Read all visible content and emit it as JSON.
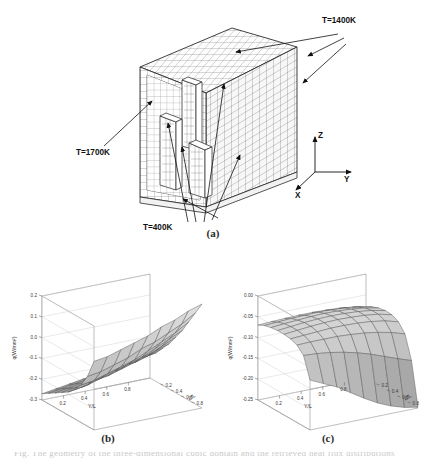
{
  "figure": {
    "panels": [
      {
        "id": "a",
        "caption": "(a)"
      },
      {
        "id": "b",
        "caption": "(b)"
      },
      {
        "id": "c",
        "caption": "(c)"
      }
    ],
    "truncated_caption_line": "Fig.  The geometry of the three-dimensional cubic domain and the retrieved heat flux distributions"
  },
  "panel_a": {
    "annotations": [
      {
        "name": "label-t1400",
        "text": "T=1400K"
      },
      {
        "name": "label-t1700",
        "text": "T=1700K"
      },
      {
        "name": "label-t400",
        "text": "T=400K"
      }
    ],
    "axis_triad": {
      "x": "X",
      "y": "Y",
      "z": "Z"
    },
    "mesh": {
      "cols": 22,
      "rows": 20,
      "line_color": "#4a4a4a"
    }
  },
  "chart_data": [
    {
      "id": "b",
      "type": "surface",
      "title": "(b)",
      "xlabel": "Y/L",
      "ylabel": "Z/L",
      "zlabel": "q(W/mm²)",
      "xticks": [
        0.8,
        0.6,
        0.4,
        0.2
      ],
      "yticks": [
        0.8,
        0.6,
        0.4,
        0.2
      ],
      "zticks": [
        0.2,
        0.1,
        0.0,
        -0.1,
        -0.2,
        -0.3
      ],
      "zlim": [
        -0.3,
        0.2
      ],
      "grid": true,
      "description": "Saddle-like surface rising steeply toward the far right corner, lowest along the near-left edge",
      "x": [
        0.1,
        0.2,
        0.3,
        0.4,
        0.5,
        0.6,
        0.7,
        0.8,
        0.9
      ],
      "y": [
        0.1,
        0.2,
        0.3,
        0.4,
        0.5,
        0.6,
        0.7,
        0.8,
        0.9
      ],
      "z": [
        [
          -0.27,
          -0.25,
          -0.23,
          -0.21,
          -0.19,
          -0.16,
          -0.12,
          -0.06,
          0.03
        ],
        [
          -0.26,
          -0.24,
          -0.22,
          -0.2,
          -0.18,
          -0.15,
          -0.11,
          -0.05,
          0.04
        ],
        [
          -0.25,
          -0.23,
          -0.21,
          -0.19,
          -0.16,
          -0.13,
          -0.09,
          -0.03,
          0.06
        ],
        [
          -0.24,
          -0.22,
          -0.2,
          -0.17,
          -0.15,
          -0.11,
          -0.07,
          -0.01,
          0.08
        ],
        [
          -0.23,
          -0.21,
          -0.18,
          -0.16,
          -0.13,
          -0.09,
          -0.05,
          0.02,
          0.1
        ],
        [
          -0.22,
          -0.2,
          -0.17,
          -0.14,
          -0.11,
          -0.07,
          -0.02,
          0.04,
          0.13
        ],
        [
          -0.21,
          -0.18,
          -0.16,
          -0.12,
          -0.09,
          -0.04,
          0.01,
          0.07,
          0.15
        ],
        [
          -0.2,
          -0.17,
          -0.14,
          -0.1,
          -0.06,
          -0.01,
          0.04,
          0.1,
          0.18
        ],
        [
          -0.19,
          -0.16,
          -0.12,
          -0.08,
          -0.03,
          0.02,
          0.08,
          0.14,
          0.2
        ]
      ]
    },
    {
      "id": "c",
      "type": "surface",
      "title": "(c)",
      "xlabel": "Y/L",
      "ylabel": "Z/L",
      "zlabel": "q(W/mm²)",
      "xticks": [
        0.8,
        0.6,
        0.4,
        0.2
      ],
      "yticks": [
        0.8,
        0.6,
        0.4,
        0.2
      ],
      "zticks": [
        0.0,
        -0.05,
        -0.1,
        -0.15,
        -0.2,
        -0.25
      ],
      "zlim": [
        -0.25,
        0.0
      ],
      "grid": true,
      "description": "Gently domed surface near the back, dropping sharply into a trough along the near-right front edge",
      "x": [
        0.1,
        0.2,
        0.3,
        0.4,
        0.5,
        0.6,
        0.7,
        0.8,
        0.9
      ],
      "y": [
        0.1,
        0.2,
        0.3,
        0.4,
        0.5,
        0.6,
        0.7,
        0.8,
        0.9
      ],
      "z": [
        [
          -0.07,
          -0.062,
          -0.058,
          -0.056,
          -0.056,
          -0.058,
          -0.064,
          -0.08,
          -0.13
        ],
        [
          -0.068,
          -0.06,
          -0.055,
          -0.053,
          -0.053,
          -0.056,
          -0.063,
          -0.082,
          -0.145
        ],
        [
          -0.067,
          -0.058,
          -0.053,
          -0.05,
          -0.05,
          -0.054,
          -0.063,
          -0.086,
          -0.16
        ],
        [
          -0.066,
          -0.057,
          -0.051,
          -0.048,
          -0.048,
          -0.052,
          -0.063,
          -0.092,
          -0.18
        ],
        [
          -0.066,
          -0.056,
          -0.05,
          -0.047,
          -0.047,
          -0.052,
          -0.065,
          -0.1,
          -0.2
        ],
        [
          -0.067,
          -0.057,
          -0.051,
          -0.048,
          -0.048,
          -0.053,
          -0.068,
          -0.11,
          -0.218
        ],
        [
          -0.069,
          -0.059,
          -0.053,
          -0.05,
          -0.05,
          -0.056,
          -0.073,
          -0.122,
          -0.232
        ],
        [
          -0.073,
          -0.063,
          -0.057,
          -0.054,
          -0.054,
          -0.061,
          -0.08,
          -0.134,
          -0.242
        ],
        [
          -0.08,
          -0.07,
          -0.064,
          -0.061,
          -0.062,
          -0.07,
          -0.09,
          -0.145,
          -0.248
        ]
      ]
    }
  ]
}
